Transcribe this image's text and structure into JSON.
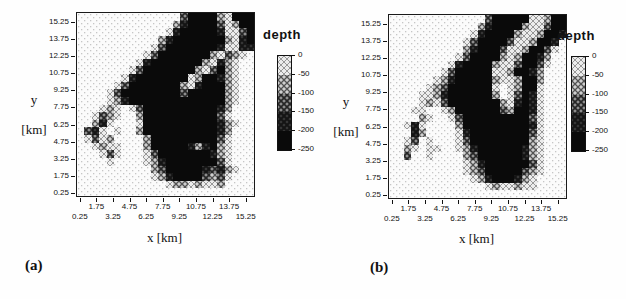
{
  "figure": {
    "panels": [
      {
        "id": "a",
        "label": "(a)",
        "x_axis_label": "x [km]",
        "y_axis_label_line1": "y",
        "y_axis_label_line2": "[km]",
        "colorbar_title": "depth",
        "colorbar_tick_labels": [
          "0",
          "-50",
          "-100",
          "-150",
          "-200",
          "-250"
        ],
        "x_tick_labels_upper_row": [
          "1.75",
          "4.75",
          "7.75",
          "10.75",
          "13.75"
        ],
        "x_tick_labels_lower_row": [
          "0.25",
          "3.25",
          "6.25",
          "9.25",
          "12.25",
          "15.25"
        ],
        "y_tick_labels": [
          "15.25",
          "13.75",
          "12.25",
          "10.75",
          "9.25",
          "7.75",
          "6.25",
          "4.75",
          "3.25",
          "1.75",
          "0.25"
        ]
      },
      {
        "id": "b",
        "label": "(b)",
        "x_axis_label": "x [km]",
        "y_axis_label_line1": "y",
        "y_axis_label_line2": "[km]",
        "colorbar_title": "depth",
        "colorbar_tick_labels": [
          "0",
          "-50",
          "-100",
          "-150",
          "-200",
          "-250"
        ],
        "x_tick_labels_upper_row": [
          "1.75",
          "4.75",
          "7.75",
          "10.75",
          "13.75"
        ],
        "x_tick_labels_lower_row": [
          "0.25",
          "3.25",
          "6.25",
          "9.25",
          "12.25",
          "15.25"
        ],
        "y_tick_labels": [
          "15.25",
          "13.75",
          "12.25",
          "10.75",
          "9.25",
          "7.75",
          "6.25",
          "4.75",
          "3.25",
          "1.75",
          "0.25"
        ]
      }
    ]
  },
  "chart_data": [
    {
      "type": "heatmap",
      "panel": "a",
      "variable": "depth",
      "xlabel": "x [km]",
      "ylabel": "y [km]",
      "x_range": [
        0,
        16
      ],
      "y_range": [
        0,
        16
      ],
      "x_ticks": [
        0.25,
        1.75,
        3.25,
        4.75,
        6.25,
        7.75,
        9.25,
        10.75,
        12.25,
        13.75,
        15.25
      ],
      "y_ticks": [
        15.25,
        13.75,
        12.25,
        10.75,
        9.25,
        7.75,
        6.25,
        4.75,
        3.25,
        1.75,
        0.25
      ],
      "colorbar": {
        "title": "depth",
        "ticks": [
          0,
          -50,
          -100,
          -150,
          -200,
          -250
        ],
        "position": "right"
      },
      "level_depths_m": [
        0,
        -50,
        -100,
        -150,
        -200,
        -250
      ],
      "palette_grays": [
        "#fbfbfb",
        "#ececec",
        "#cfcfcf",
        "#8f8f8f",
        "#383838",
        "#0a0a0a"
      ],
      "grid_cell_km": 0.667,
      "grid_levels_rows_top_to_bottom": [
        "000000000000003555521555",
        "000000000000024555531255",
        "000000000000145555541135",
        "000000000002455555552145",
        "000000000013555555541144",
        "000000000135555555213210",
        "000000001455555552142100",
        "000000013555555521352100",
        "000000145555555125542100",
        "000001355555552145552100",
        "000013555555553555552100",
        "000012455555555555552100",
        "000121013555555555542000",
        "001321002555555555531000",
        "002410001555555555542100",
        "034101002555555555542000",
        "013120000255555555531000",
        "001211000255555424521000",
        "000131000135555555421000",
        "000010000124555555531000",
        "000000000023555554342100",
        "000000000012455553231000",
        "000000000000122121120000",
        "000000000000000000000000"
      ]
    },
    {
      "type": "heatmap",
      "panel": "b",
      "variable": "depth",
      "xlabel": "x [km]",
      "ylabel": "y [km]",
      "x_range": [
        0,
        16
      ],
      "y_range": [
        0,
        16
      ],
      "x_ticks": [
        0.25,
        1.75,
        3.25,
        4.75,
        6.25,
        7.75,
        9.25,
        10.75,
        12.25,
        13.75,
        15.25
      ],
      "y_ticks": [
        15.25,
        13.75,
        12.25,
        10.75,
        9.25,
        7.75,
        6.25,
        4.75,
        3.25,
        1.75,
        0.25
      ],
      "colorbar": {
        "title": "depth",
        "ticks": [
          0,
          -50,
          -100,
          -150,
          -200,
          -250
        ],
        "position": "right"
      },
      "level_depths_m": [
        0,
        -50,
        -100,
        -150,
        -200,
        -250
      ],
      "palette_grays": [
        "#fbfbfb",
        "#ececec",
        "#cfcfcf",
        "#8f8f8f",
        "#383838",
        "#0a0a0a"
      ],
      "grid_cell_km": 0.667,
      "grid_levels_rows_top_to_bottom": [
        "000000000000035555511255",
        "000000000000245555211355",
        "000000000001455552112554",
        "000000000013555531125540",
        "000000000024555311255310",
        "000000000135555212554200",
        "000000001455552113553100",
        "000000013555551125542000",
        "000000124555552112552000",
        "000001235555551012551000",
        "000011245555552013541000",
        "000012135555555214541000",
        "000110012555555325541000",
        "000021001355555555531000",
        "001410000255555555541000",
        "000420000145555555531000",
        "001301000135555555521000",
        "002101100124555555421000",
        "003001000023555555421000",
        "000000000012455555531000",
        "000000000012355555321000",
        "000000000001245554210000",
        "000000000000012112110000",
        "000000000000000000000000"
      ]
    }
  ]
}
